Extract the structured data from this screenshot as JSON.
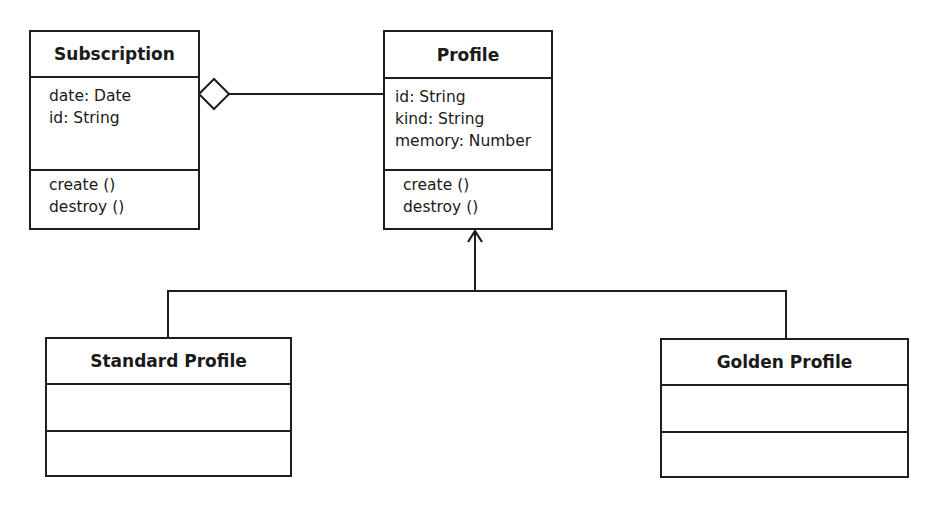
{
  "diagram": {
    "type": "UML class diagram",
    "classes": [
      {
        "id": "subscription",
        "name": "Subscription",
        "attributes": [
          "date: Date",
          "id: String"
        ],
        "operations": [
          "create ()",
          "destroy ()"
        ]
      },
      {
        "id": "profile",
        "name": "Profile",
        "attributes": [
          "id: String",
          "kind: String",
          "memory: Number"
        ],
        "operations": [
          "create ()",
          "destroy ()"
        ]
      },
      {
        "id": "standard_profile",
        "name": "Standard Profile",
        "attributes": [],
        "operations": []
      },
      {
        "id": "golden_profile",
        "name": "Golden Profile",
        "attributes": [],
        "operations": []
      }
    ],
    "relationships": [
      {
        "type": "aggregation",
        "whole": "Subscription",
        "part": "Profile"
      },
      {
        "type": "generalization",
        "parent": "Profile",
        "child": "Standard Profile"
      },
      {
        "type": "generalization",
        "parent": "Profile",
        "child": "Golden Profile"
      }
    ],
    "colors": {
      "stroke": "#1e1e1e",
      "background": "#ffffff",
      "text": "#1a1a1a"
    }
  }
}
